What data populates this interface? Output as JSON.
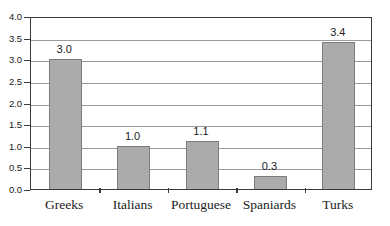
{
  "chart_data": {
    "type": "bar",
    "title": "",
    "subtitle": "",
    "xlabel": "",
    "ylabel": "",
    "categories": [
      "Greeks",
      "Italians",
      "Portuguese",
      "Spaniards",
      "Turks"
    ],
    "values": [
      3.0,
      1.0,
      1.1,
      0.3,
      3.4
    ],
    "value_labels": [
      "3.0",
      "1.0",
      "1.1",
      "0.3",
      "3.4"
    ],
    "ylim": [
      0.0,
      4.0
    ],
    "ytick_values": [
      0.0,
      0.5,
      1.0,
      1.5,
      2.0,
      2.5,
      3.0,
      3.5,
      4.0
    ],
    "ytick_labels": [
      "0.0",
      "0.5",
      "1.0",
      "1.5",
      "2.0",
      "2.5",
      "3.0",
      "3.5",
      "4.0"
    ],
    "grid": true,
    "legend": false,
    "legend_position": "none",
    "annotations": [],
    "colors": {
      "bar_fill": "#ababab",
      "bar_border": "#7d7d7d",
      "gridline": "#9a9a9a",
      "axis": "#3a3a3a",
      "text": "#1a1a1a",
      "background": "#ffffff"
    }
  }
}
